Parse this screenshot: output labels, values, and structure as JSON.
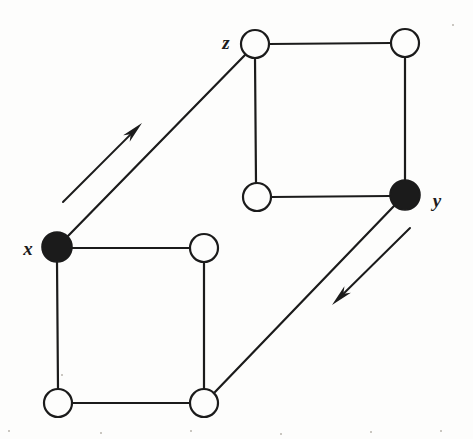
{
  "figure": {
    "width": 473,
    "height": 439,
    "background_color": "#fdfdfc",
    "ink_color": "#1b1b1b",
    "stroke_width": 2.2,
    "node_radius": 14,
    "filled_node_radius": 15
  },
  "graph_data": {
    "type": "diagram",
    "vertices": [
      {
        "id": "z",
        "label": "z",
        "label_side": "left",
        "label_x": 226,
        "label_y": 42,
        "x": 255,
        "y": 44,
        "fill": "open"
      },
      {
        "id": "a",
        "label": "",
        "label_side": "none",
        "label_x": 0,
        "label_y": 0,
        "x": 405,
        "y": 43,
        "fill": "open"
      },
      {
        "id": "b",
        "label": "",
        "label_side": "none",
        "label_x": 0,
        "label_y": 0,
        "x": 257,
        "y": 197,
        "fill": "open"
      },
      {
        "id": "y",
        "label": "y",
        "label_side": "right",
        "label_x": 437,
        "label_y": 200,
        "x": 405,
        "y": 195,
        "fill": "filled"
      },
      {
        "id": "x",
        "label": "x",
        "label_side": "left",
        "label_x": 28,
        "label_y": 248,
        "x": 57,
        "y": 247,
        "fill": "filled"
      },
      {
        "id": "c",
        "label": "",
        "label_side": "none",
        "label_x": 0,
        "label_y": 0,
        "x": 204,
        "y": 248,
        "fill": "open"
      },
      {
        "id": "d",
        "label": "",
        "label_side": "none",
        "label_x": 0,
        "label_y": 0,
        "x": 58,
        "y": 403,
        "fill": "open"
      },
      {
        "id": "e",
        "label": "",
        "label_side": "none",
        "label_x": 0,
        "label_y": 0,
        "x": 204,
        "y": 403,
        "fill": "open"
      }
    ],
    "edges": [
      {
        "from": "z",
        "to": "a",
        "kind": "top-square-top",
        "x1": 269,
        "y1": 44,
        "x2": 391,
        "y2": 43
      },
      {
        "from": "a",
        "to": "y",
        "kind": "top-square-right",
        "x1": 405,
        "y1": 57,
        "x2": 405,
        "y2": 181
      },
      {
        "from": "y",
        "to": "b",
        "kind": "top-square-bottom",
        "x1": 390,
        "y1": 196,
        "x2": 271,
        "y2": 197
      },
      {
        "from": "b",
        "to": "z",
        "kind": "top-square-left",
        "x1": 256,
        "y1": 183,
        "x2": 255,
        "y2": 58
      },
      {
        "from": "x",
        "to": "c",
        "kind": "bottom-square-top",
        "x1": 72,
        "y1": 248,
        "x2": 190,
        "y2": 248
      },
      {
        "from": "c",
        "to": "e",
        "kind": "bottom-square-right",
        "x1": 204,
        "y1": 262,
        "x2": 204,
        "y2": 389
      },
      {
        "from": "e",
        "to": "d",
        "kind": "bottom-square-bottom",
        "x1": 190,
        "y1": 403,
        "x2": 72,
        "y2": 403
      },
      {
        "from": "d",
        "to": "x",
        "kind": "bottom-square-left",
        "x1": 58,
        "y1": 389,
        "x2": 57,
        "y2": 262
      },
      {
        "from": "x",
        "to": "z",
        "kind": "diagonal-lower-left",
        "x1": 68,
        "y1": 236,
        "x2": 245,
        "y2": 55
      },
      {
        "from": "y",
        "to": "e",
        "kind": "diagonal-lower-right",
        "x1": 394,
        "y1": 206,
        "x2": 215,
        "y2": 392
      }
    ],
    "arrows": [
      {
        "id": "arrow-x-to-z",
        "direction": "up-right",
        "meaning": "maps x toward z",
        "tail_x": 63,
        "tail_y": 202,
        "tip_x": 142,
        "tip_y": 123
      },
      {
        "id": "arrow-y-downward",
        "direction": "down-left",
        "meaning": "maps y toward the lower-right vertex",
        "tail_x": 410,
        "tail_y": 228,
        "tip_x": 332,
        "tip_y": 305
      }
    ],
    "legend": {
      "filled_meaning": "distinguished vertices (x, y)",
      "open_meaning": "ordinary vertices"
    }
  },
  "specks": [
    {
      "x": 61,
      "y": 374
    },
    {
      "x": 452,
      "y": 24
    },
    {
      "x": 8,
      "y": 430
    },
    {
      "x": 100,
      "y": 432
    },
    {
      "x": 190,
      "y": 430
    },
    {
      "x": 280,
      "y": 433
    },
    {
      "x": 370,
      "y": 431
    },
    {
      "x": 440,
      "y": 430
    }
  ]
}
